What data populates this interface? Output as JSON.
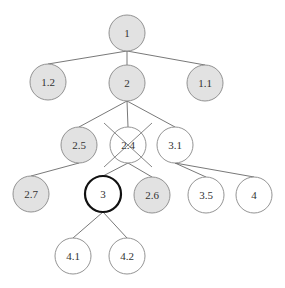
{
  "diagram": {
    "type": "tree",
    "colors": {
      "shaded_fill": "#e2e2e2",
      "plain_fill": "#ffffff",
      "stroke": "#888888",
      "highlight_stroke": "#111111",
      "edge": "#555555"
    },
    "nodes": [
      {
        "id": "1",
        "label": "1",
        "x": 127,
        "y": 33,
        "shaded": true,
        "bold": false,
        "crossed": false
      },
      {
        "id": "1.2",
        "label": "1.2",
        "x": 48,
        "y": 82,
        "shaded": true,
        "bold": false,
        "crossed": false
      },
      {
        "id": "2",
        "label": "2",
        "x": 127,
        "y": 83,
        "shaded": true,
        "bold": false,
        "crossed": false
      },
      {
        "id": "1.1",
        "label": "1.1",
        "x": 205,
        "y": 83,
        "shaded": true,
        "bold": false,
        "crossed": false
      },
      {
        "id": "2.5",
        "label": "2.5",
        "x": 79,
        "y": 145,
        "shaded": true,
        "bold": false,
        "crossed": false
      },
      {
        "id": "2.4",
        "label": "2.4",
        "x": 128,
        "y": 145,
        "shaded": false,
        "bold": false,
        "crossed": true
      },
      {
        "id": "3.1",
        "label": "3.1",
        "x": 175,
        "y": 145,
        "shaded": false,
        "bold": false,
        "crossed": false
      },
      {
        "id": "2.7",
        "label": "2.7",
        "x": 31,
        "y": 194,
        "shaded": true,
        "bold": false,
        "crossed": false
      },
      {
        "id": "3",
        "label": "3",
        "x": 103,
        "y": 194,
        "shaded": false,
        "bold": true,
        "crossed": false
      },
      {
        "id": "2.6",
        "label": "2.6",
        "x": 152,
        "y": 195,
        "shaded": true,
        "bold": false,
        "crossed": false
      },
      {
        "id": "3.5",
        "label": "3.5",
        "x": 206,
        "y": 195,
        "shaded": false,
        "bold": false,
        "crossed": false
      },
      {
        "id": "4",
        "label": "4",
        "x": 254,
        "y": 195,
        "shaded": false,
        "bold": false,
        "crossed": false
      },
      {
        "id": "4.1",
        "label": "4.1",
        "x": 73,
        "y": 256,
        "shaded": false,
        "bold": false,
        "crossed": false
      },
      {
        "id": "4.2",
        "label": "4.2",
        "x": 127,
        "y": 256,
        "shaded": false,
        "bold": false,
        "crossed": false
      }
    ],
    "edges": [
      [
        "1",
        "1.2"
      ],
      [
        "1",
        "2"
      ],
      [
        "1",
        "1.1"
      ],
      [
        "2",
        "2.5"
      ],
      [
        "2",
        "2.4"
      ],
      [
        "2",
        "3.1"
      ],
      [
        "2.5",
        "2.7"
      ],
      [
        "2.4",
        "3"
      ],
      [
        "2.4",
        "2.6"
      ],
      [
        "3.1",
        "3.5"
      ],
      [
        "3.1",
        "4"
      ],
      [
        "3",
        "4.1"
      ],
      [
        "3",
        "4.2"
      ]
    ],
    "radius": 18
  }
}
